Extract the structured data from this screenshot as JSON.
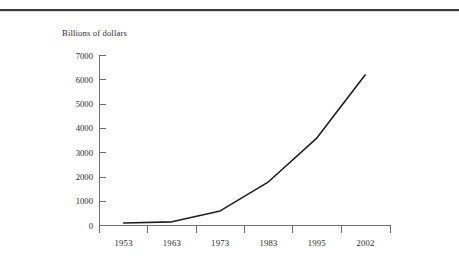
{
  "page": {
    "background_color": "#ffffff",
    "rule_color": "#3a3a3c"
  },
  "chart_data": {
    "type": "line",
    "title": "",
    "subtitle": "",
    "ylabel": "Billions of dollars",
    "xlabel": "",
    "categories": [
      "1953",
      "1963",
      "1973",
      "1983",
      "1995",
      "2002"
    ],
    "values": [
      100,
      150,
      600,
      1800,
      3600,
      6200
    ],
    "series": [
      {
        "name": "Billions of dollars",
        "values": [
          100,
          150,
          600,
          1800,
          3600,
          6200
        ],
        "color": "#1d1d1f"
      }
    ],
    "x": [
      "1953",
      "1963",
      "1973",
      "1983",
      "1995",
      "2002"
    ],
    "ylim": [
      0,
      7000
    ],
    "y_ticks": [
      "0",
      "1000",
      "2000",
      "3000",
      "4000",
      "5000",
      "6000",
      "7000"
    ],
    "y_tick_values": [
      0,
      1000,
      2000,
      3000,
      4000,
      5000,
      6000,
      7000
    ],
    "x_ticks": [
      "1953",
      "1963",
      "1973",
      "1983",
      "1995",
      "2002"
    ],
    "grid": false,
    "legend": false,
    "legend_position": "none",
    "line_color": "#1d1d1f",
    "axis_color": "#6e6e70"
  },
  "axis": {
    "y_title": "Billions of dollars",
    "y_labels": [
      "7000",
      "6000",
      "5000",
      "4000",
      "3000",
      "2000",
      "1000",
      "0"
    ],
    "x_labels": [
      "1953",
      "1963",
      "1973",
      "1983",
      "1995",
      "2002"
    ]
  }
}
